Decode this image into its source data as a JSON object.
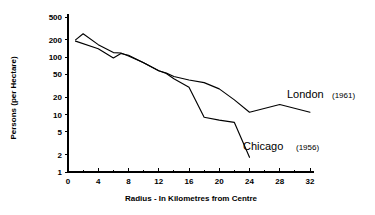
{
  "chart_data": {
    "type": "line",
    "title": "",
    "xlabel": "Radius - In Kilometres from Centre",
    "ylabel": "Persons (per Hectare)",
    "yscale": "log",
    "xlim": [
      0,
      32
    ],
    "ylim": [
      1,
      500
    ],
    "grid": false,
    "legend_position": "inline-right",
    "xticks": [
      0,
      4,
      8,
      12,
      16,
      20,
      24,
      28,
      32
    ],
    "xtick_labels": [
      "0",
      "4",
      "8",
      "12",
      "16",
      "20",
      "24",
      "28",
      "32"
    ],
    "yticks": [
      1,
      2,
      5,
      10,
      20,
      50,
      100,
      200,
      500
    ],
    "ytick_labels": [
      "1",
      "2",
      "5",
      "10",
      "20",
      "50",
      "100",
      "200",
      "500"
    ],
    "series": [
      {
        "name": "London",
        "year": "(1961)",
        "label_full": "London (1961)",
        "points": [
          [
            1,
            200
          ],
          [
            2,
            255
          ],
          [
            4,
            165
          ],
          [
            6,
            120
          ],
          [
            7,
            118
          ],
          [
            8,
            105
          ],
          [
            10,
            80
          ],
          [
            12,
            58
          ],
          [
            13,
            53
          ],
          [
            14,
            46
          ],
          [
            16,
            40
          ],
          [
            18,
            36
          ],
          [
            20,
            28
          ],
          [
            22,
            18
          ],
          [
            24,
            11
          ],
          [
            28,
            15
          ],
          [
            32,
            11
          ]
        ]
      },
      {
        "name": "Chicago",
        "year": "(1956)",
        "label_full": "Chicago (1956)",
        "points": [
          [
            1,
            190
          ],
          [
            4,
            140
          ],
          [
            6,
            97
          ],
          [
            7,
            116
          ],
          [
            8,
            108
          ],
          [
            10,
            80
          ],
          [
            12,
            58
          ],
          [
            13,
            52
          ],
          [
            14,
            42
          ],
          [
            16,
            30
          ],
          [
            18,
            9
          ],
          [
            20,
            8
          ],
          [
            22,
            7.3
          ],
          [
            24,
            1.8
          ]
        ]
      }
    ]
  },
  "labels": {
    "london_name": "London",
    "london_year": "(1961)",
    "chicago_name": "Chicago",
    "chicago_year": "(1956)"
  }
}
